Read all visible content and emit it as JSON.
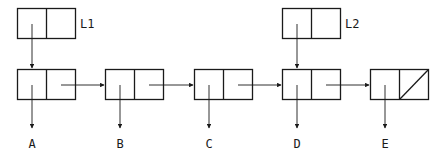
{
  "diagram": {
    "colors": {
      "stroke": "#1a1a1a",
      "background": "#ffffff"
    },
    "heads": [
      {
        "id": "L1",
        "label": "L1",
        "points_to": "A"
      },
      {
        "id": "L2",
        "label": "L2",
        "points_to": "D"
      }
    ],
    "nodes": [
      {
        "id": "n1",
        "value": "A",
        "next": "n2"
      },
      {
        "id": "n2",
        "value": "B",
        "next": "n3"
      },
      {
        "id": "n3",
        "value": "C",
        "next": "n4"
      },
      {
        "id": "n4",
        "value": "D",
        "next": "n5"
      },
      {
        "id": "n5",
        "value": "E",
        "next": null,
        "null_marker": "diagonal-slash"
      }
    ]
  }
}
